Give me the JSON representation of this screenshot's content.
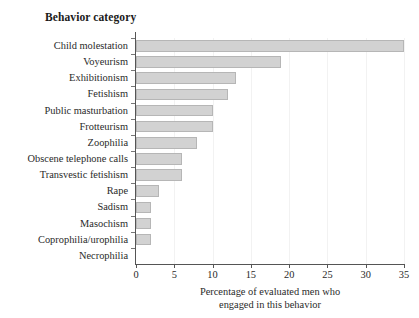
{
  "chart_data": {
    "type": "bar",
    "orientation": "horizontal",
    "title": "Behavior category",
    "xlabel_line1": "Percentage of evaluated men who",
    "xlabel_line2": "engaged in this behavior",
    "ylabel": "",
    "xlim": [
      0,
      35
    ],
    "xticks": [
      0,
      5,
      10,
      15,
      20,
      25,
      30,
      35
    ],
    "xtick_labels": [
      "0",
      "5",
      "10",
      "15",
      "20",
      "25",
      "30",
      "35"
    ],
    "grid": true,
    "grid_axis": "x",
    "legend": false,
    "bar_fill_color": "#d2d2d2",
    "bar_border_color": "#b6b6b6",
    "axis_color": "#555555",
    "background_color": "#ffffff",
    "categories": [
      "Child molestation",
      "Voyeurism",
      "Exhibitionism",
      "Fetishism",
      "Public masturbation",
      "Frotteurism",
      "Zoophilia",
      "Obscene telephone calls",
      "Transvestic fetishism",
      "Rape",
      "Sadism",
      "Masochism",
      "Coprophilia/urophilia",
      "Necrophilia"
    ],
    "values": [
      35,
      19,
      13,
      12,
      10,
      10,
      8,
      6,
      6,
      3,
      2,
      2,
      2,
      0
    ]
  }
}
